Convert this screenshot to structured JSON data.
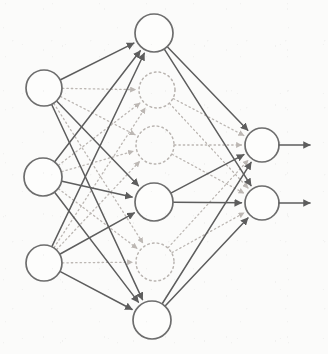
{
  "figure": {
    "name": "neural-network-diagram",
    "type": "feedforward-neural-network",
    "background_color": "#fbfbfa",
    "solid_stroke_color": "#5d5d5d",
    "ghost_stroke_color": "#bcb7b3",
    "node_fill_color": "#fdfdfc"
  },
  "layers": [
    {
      "id": "input",
      "name": "input-layer",
      "style": "solid",
      "node_radius": 18,
      "nodes": [
        {
          "id": "i1",
          "name": "input-node-1",
          "cx": 44,
          "cy": 88,
          "r": 18
        },
        {
          "id": "i2",
          "name": "input-node-2",
          "cx": 43,
          "cy": 177,
          "r": 19
        },
        {
          "id": "i3",
          "name": "input-node-3",
          "cx": 44,
          "cy": 263,
          "r": 18
        }
      ]
    },
    {
      "id": "hidden",
      "name": "hidden-layer",
      "style": "solid",
      "node_radius": 19,
      "nodes": [
        {
          "id": "h1",
          "name": "hidden-node-1",
          "cx": 154,
          "cy": 33,
          "r": 19
        },
        {
          "id": "h2",
          "name": "hidden-node-2",
          "cx": 154,
          "cy": 202,
          "r": 19
        },
        {
          "id": "h3",
          "name": "hidden-node-3",
          "cx": 152,
          "cy": 320,
          "r": 19
        }
      ]
    },
    {
      "id": "hidden_dropped",
      "name": "hidden-layer-dropped-units",
      "style": "dotted",
      "node_radius": 19,
      "nodes": [
        {
          "id": "d1",
          "name": "dropped-node-1",
          "cx": 157,
          "cy": 90,
          "r": 18
        },
        {
          "id": "d2",
          "name": "dropped-node-2",
          "cx": 155,
          "cy": 145,
          "r": 19
        },
        {
          "id": "d3",
          "name": "dropped-node-3",
          "cx": 155,
          "cy": 262,
          "r": 19
        }
      ]
    },
    {
      "id": "output",
      "name": "output-layer",
      "style": "solid",
      "node_radius": 17,
      "nodes": [
        {
          "id": "o1",
          "name": "output-node-1",
          "cx": 262,
          "cy": 145,
          "r": 17
        },
        {
          "id": "o2",
          "name": "output-node-2",
          "cx": 262,
          "cy": 203,
          "r": 17
        }
      ]
    }
  ],
  "edges_solid": [
    {
      "name": "edge-i1-h1",
      "from": "i1",
      "to": "h1"
    },
    {
      "name": "edge-i1-h2",
      "from": "i1",
      "to": "h2"
    },
    {
      "name": "edge-i1-h3",
      "from": "i1",
      "to": "h3"
    },
    {
      "name": "edge-i2-h1",
      "from": "i2",
      "to": "h1"
    },
    {
      "name": "edge-i2-h2",
      "from": "i2",
      "to": "h2"
    },
    {
      "name": "edge-i2-h3",
      "from": "i2",
      "to": "h3"
    },
    {
      "name": "edge-i3-h1",
      "from": "i3",
      "to": "h1"
    },
    {
      "name": "edge-i3-h2",
      "from": "i3",
      "to": "h2"
    },
    {
      "name": "edge-i3-h3",
      "from": "i3",
      "to": "h3"
    },
    {
      "name": "edge-h1-o1",
      "from": "h1",
      "to": "o1"
    },
    {
      "name": "edge-h1-o2",
      "from": "h1",
      "to": "o2"
    },
    {
      "name": "edge-h2-o1",
      "from": "h2",
      "to": "o1"
    },
    {
      "name": "edge-h2-o2",
      "from": "h2",
      "to": "o2"
    },
    {
      "name": "edge-h3-o1",
      "from": "h3",
      "to": "o1"
    },
    {
      "name": "edge-h3-o2",
      "from": "h3",
      "to": "o2"
    }
  ],
  "edges_dotted": [
    {
      "name": "edge-i1-d1",
      "from": "i1",
      "to": "d1"
    },
    {
      "name": "edge-i1-d2",
      "from": "i1",
      "to": "d2"
    },
    {
      "name": "edge-i1-d3",
      "from": "i1",
      "to": "d3"
    },
    {
      "name": "edge-i2-d1",
      "from": "i2",
      "to": "d1"
    },
    {
      "name": "edge-i2-d2",
      "from": "i2",
      "to": "d2"
    },
    {
      "name": "edge-i2-d3",
      "from": "i2",
      "to": "d3"
    },
    {
      "name": "edge-i3-d1",
      "from": "i3",
      "to": "d1"
    },
    {
      "name": "edge-i3-d2",
      "from": "i3",
      "to": "d2"
    },
    {
      "name": "edge-i3-d3",
      "from": "i3",
      "to": "d3"
    },
    {
      "name": "edge-d1-o1",
      "from": "d1",
      "to": "o1"
    },
    {
      "name": "edge-d1-o2",
      "from": "d1",
      "to": "o2"
    },
    {
      "name": "edge-d2-o1",
      "from": "d2",
      "to": "o1"
    },
    {
      "name": "edge-d2-o2",
      "from": "d2",
      "to": "o2"
    },
    {
      "name": "edge-d3-o1",
      "from": "d3",
      "to": "o1"
    },
    {
      "name": "edge-d3-o2",
      "from": "d3",
      "to": "o2"
    }
  ],
  "output_arrows": [
    {
      "name": "output-arrow-1",
      "from": "o1",
      "x1": 279,
      "y1": 145,
      "x2": 310,
      "y2": 145
    },
    {
      "name": "output-arrow-2",
      "from": "o2",
      "x1": 279,
      "y1": 203,
      "x2": 310,
      "y2": 203
    }
  ]
}
